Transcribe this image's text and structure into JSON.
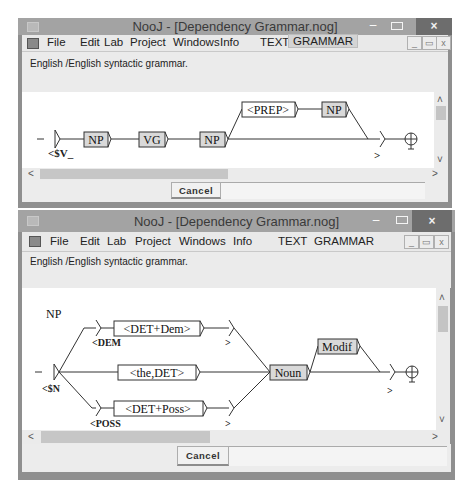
{
  "windows": [
    {
      "title": "NooJ - [Dependency Grammar.nog]",
      "menu": [
        "File",
        "Edit",
        "Lab",
        "Project",
        "Windows",
        "Info",
        "TEXT",
        "GRAMMAR"
      ],
      "active_menu": "GRAMMAR",
      "description": "English /English  syntactic grammar.",
      "cancel_label": "Cancel",
      "window_controls": {
        "minimize": "–",
        "close": "×"
      },
      "mdi_controls": {
        "minimize": "_",
        "restore": "🗗",
        "close": "x"
      },
      "graph": {
        "nodes": [
          {
            "id": "start",
            "type": "initial"
          },
          {
            "id": "np1",
            "label": "NP",
            "shaded": true
          },
          {
            "id": "vg",
            "label": "VG",
            "shaded": true
          },
          {
            "id": "np2",
            "label": "NP",
            "shaded": true
          },
          {
            "id": "prep",
            "label": "<PREP>",
            "shaded": false
          },
          {
            "id": "np3",
            "label": "NP",
            "shaded": true
          },
          {
            "id": "end",
            "type": "terminal"
          }
        ],
        "annotations": {
          "open": "<$V_",
          "close": ">"
        }
      }
    },
    {
      "title": "NooJ - [Dependency Grammar.nog]",
      "menu": [
        "File",
        "Edit",
        "Lab",
        "Project",
        "Windows",
        "Info",
        "TEXT",
        "GRAMMAR"
      ],
      "active_menu": "",
      "description": "English /English  syntactic grammar.",
      "cancel_label": "Cancel",
      "window_controls": {
        "minimize": "–",
        "close": "×"
      },
      "mdi_controls": {
        "minimize": "_",
        "restore": "🗗",
        "close": "x"
      },
      "graph": {
        "graph_name": "NP",
        "nodes": [
          {
            "id": "start",
            "type": "initial"
          },
          {
            "id": "dem",
            "label": "<DET+Dem>",
            "shaded": false
          },
          {
            "id": "the",
            "label": "<the,DET>",
            "shaded": false
          },
          {
            "id": "poss",
            "label": "<DET+Poss>",
            "shaded": false
          },
          {
            "id": "noun",
            "label": "Noun",
            "shaded": true
          },
          {
            "id": "modif",
            "label": "Modif",
            "shaded": true
          },
          {
            "id": "end",
            "type": "terminal"
          }
        ],
        "annotations": {
          "open_n": "<$N",
          "open_dem": "<DEM",
          "close_dem": ">",
          "open_poss": "<POSS",
          "close_poss": ">",
          "close_n": ">"
        }
      }
    }
  ]
}
